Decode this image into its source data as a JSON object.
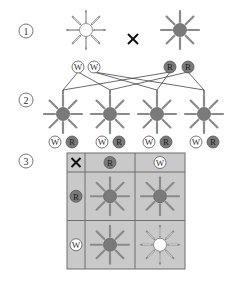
{
  "steps": [
    {
      "label": "1",
      "x": 26,
      "y": 31
    },
    {
      "label": "2",
      "x": 26,
      "y": 100
    },
    {
      "label": "3",
      "x": 26,
      "y": 161
    }
  ],
  "colors": {
    "flower_center_red": "#7a7a7a",
    "flower_center_white": "#ffffff",
    "ray": "#8a8a8a",
    "allele_R": "#7a7a7a",
    "allele_W": "#ffffff",
    "grid_fill": "#c9c9c9",
    "grid_line": "#6f6f6f",
    "line": "#444444",
    "text": "#333333"
  },
  "cross_symbol": "×",
  "parents": [
    {
      "id": "parent-white",
      "x": 86,
      "y": 30,
      "center": "white",
      "alleles": [
        {
          "label": "W",
          "x": 78,
          "y": 67
        },
        {
          "label": "W",
          "x": 94,
          "y": 67
        }
      ]
    },
    {
      "id": "parent-red",
      "x": 180,
      "y": 30,
      "center": "red",
      "alleles": [
        {
          "label": "R",
          "x": 170,
          "y": 67
        },
        {
          "label": "R",
          "x": 188,
          "y": 67
        }
      ]
    }
  ],
  "offspring": [
    {
      "x": 63,
      "y": 114,
      "center": "red",
      "alleles": [
        {
          "label": "W",
          "x": 55,
          "y": 142
        },
        {
          "label": "R",
          "x": 72,
          "y": 142
        }
      ]
    },
    {
      "x": 110,
      "y": 114,
      "center": "red",
      "alleles": [
        {
          "label": "W",
          "x": 102,
          "y": 142
        },
        {
          "label": "R",
          "x": 119,
          "y": 142
        }
      ]
    },
    {
      "x": 157,
      "y": 114,
      "center": "red",
      "alleles": [
        {
          "label": "W",
          "x": 149,
          "y": 142
        },
        {
          "label": "R",
          "x": 166,
          "y": 142
        }
      ]
    },
    {
      "x": 204,
      "y": 114,
      "center": "red",
      "alleles": [
        {
          "label": "W",
          "x": 196,
          "y": 142
        },
        {
          "label": "R",
          "x": 213,
          "y": 142
        }
      ]
    }
  ],
  "punnett": {
    "corner": "×",
    "col_headers": [
      "R",
      "W"
    ],
    "row_headers": [
      "R",
      "W"
    ],
    "cells": [
      [
        "red",
        "red"
      ],
      [
        "red",
        "white"
      ]
    ]
  }
}
